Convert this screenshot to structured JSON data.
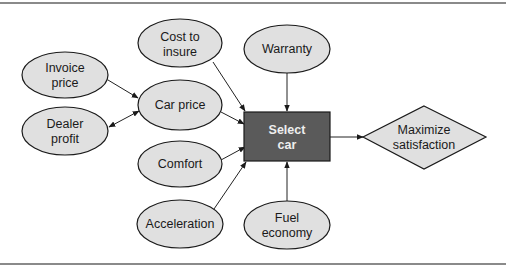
{
  "diagram": {
    "type": "influence-diagram",
    "nodes": {
      "invoice_price": {
        "kind": "chance",
        "lines": [
          "Invoice",
          "price"
        ]
      },
      "dealer_profit": {
        "kind": "chance",
        "lines": [
          "Dealer",
          "profit"
        ]
      },
      "cost_to_insure": {
        "kind": "chance",
        "lines": [
          "Cost to",
          "insure"
        ]
      },
      "car_price": {
        "kind": "chance",
        "lines": [
          "Car price"
        ]
      },
      "comfort": {
        "kind": "chance",
        "lines": [
          "Comfort"
        ]
      },
      "acceleration": {
        "kind": "chance",
        "lines": [
          "Acceleration"
        ]
      },
      "warranty": {
        "kind": "chance",
        "lines": [
          "Warranty"
        ]
      },
      "fuel_economy": {
        "kind": "chance",
        "lines": [
          "Fuel",
          "economy"
        ]
      },
      "select_car": {
        "kind": "decision",
        "lines": [
          "Select",
          "car"
        ]
      },
      "maximize_satisfaction": {
        "kind": "value",
        "lines": [
          "Maximize",
          "satisfaction"
        ]
      }
    },
    "edges": [
      {
        "from": "Invoice price",
        "to": "Car price",
        "direction": "forward"
      },
      {
        "from": "Dealer profit",
        "to": "Car price",
        "direction": "both"
      },
      {
        "from": "Cost to insure",
        "to": "Select car",
        "direction": "forward"
      },
      {
        "from": "Car price",
        "to": "Select car",
        "direction": "forward"
      },
      {
        "from": "Comfort",
        "to": "Select car",
        "direction": "forward"
      },
      {
        "from": "Acceleration",
        "to": "Select car",
        "direction": "forward"
      },
      {
        "from": "Warranty",
        "to": "Select car",
        "direction": "forward"
      },
      {
        "from": "Fuel economy",
        "to": "Select car",
        "direction": "forward"
      },
      {
        "from": "Select car",
        "to": "Maximize satisfaction",
        "direction": "forward"
      }
    ],
    "colors": {
      "chance_fill": "#e0e0e0",
      "decision_fill": "#5a5a5a",
      "decision_text": "#eeeeee",
      "stroke": "#1a1a1a",
      "frame_rule": "#8a8a8a"
    }
  }
}
